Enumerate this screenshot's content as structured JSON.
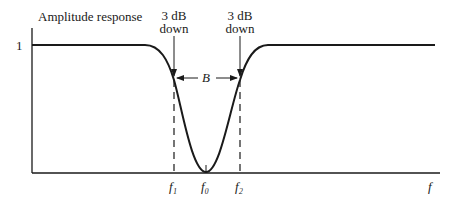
{
  "figure": {
    "y_axis_label": "Amplitude response",
    "y_tick_label": "1",
    "x_axis_label": "f",
    "annotations": {
      "left_marker_line1": "3 dB",
      "left_marker_line2": "down",
      "right_marker_line1": "3 dB",
      "right_marker_line2": "down",
      "bandwidth": "B"
    },
    "x_ticks": {
      "f1": "f₁",
      "f0": "f₀",
      "f2": "f₂"
    },
    "colors": {
      "ink": "#1a1a1a",
      "background": "#ffffff"
    }
  }
}
